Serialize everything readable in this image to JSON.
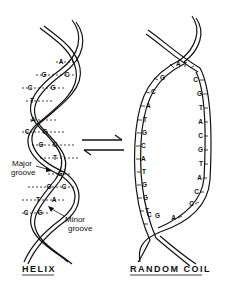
{
  "figure": {
    "helix": {
      "title": "HELIX",
      "annotations": {
        "major_groove": [
          "Major",
          "groove"
        ],
        "minor_groove": [
          "Minor",
          "groove"
        ]
      },
      "base_pairs": [
        {
          "left": "",
          "right": "A"
        },
        {
          "left": "G",
          "right": "C"
        },
        {
          "left": "C",
          "right": "G"
        },
        {
          "left": "T",
          "right": ""
        },
        {
          "left": "A",
          "right": ""
        },
        {
          "left": "C",
          "right": "G"
        },
        {
          "left": "G",
          "right": "C"
        },
        {
          "left": "T",
          "right": ""
        },
        {
          "left": "",
          "right": "G"
        },
        {
          "left": "G",
          "right": "C"
        },
        {
          "left": "T",
          "right": "A"
        },
        {
          "left": "C",
          "right": "G"
        }
      ]
    },
    "random_coil": {
      "title": "RANDOM COIL",
      "left_strand": [
        "A",
        "G",
        "C",
        "A",
        "T",
        "G",
        "C",
        "A",
        "T",
        "G",
        "G",
        "T",
        "C",
        "G"
      ],
      "right_strand": [
        "T",
        "C",
        "G",
        "T",
        "A",
        "C",
        "G",
        "T",
        "A",
        "C",
        "C",
        "A"
      ]
    },
    "equilibrium_arrows": "⇌",
    "colors": {
      "ink": "#111111",
      "background": "#ffffff"
    }
  }
}
